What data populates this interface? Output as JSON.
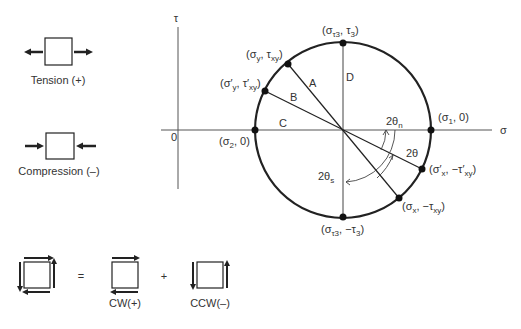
{
  "sign_convention": {
    "tension_label": "Tension (+)",
    "compression_label": "Compression (–)"
  },
  "mohr_circle": {
    "axis_labels": {
      "tau": "τ",
      "sigma": "σ",
      "origin": "0"
    },
    "line_labels": {
      "A": "A",
      "B": "B",
      "C": "C",
      "D": "D"
    },
    "points": {
      "top": {
        "open": "(σ",
        "sub1": "τ3",
        "mid": ", τ",
        "sub2": "3",
        "close": ")"
      },
      "bottom": {
        "open": "(σ",
        "sub1": "τ3",
        "mid": ", −τ",
        "sub2": "3",
        "close": ")"
      },
      "sigma_y": {
        "open": "(σ",
        "sub1": "y",
        "mid": ", τ",
        "sub2": "xy",
        "close": ")"
      },
      "sigma_y_p": {
        "open": "(σ′",
        "sub1": "y",
        "mid": ", τ′",
        "sub2": "xy",
        "close": ")"
      },
      "sigma_2": {
        "open": "(σ",
        "sub1": "2",
        "mid": ", 0",
        "sub2": "",
        "close": ")"
      },
      "sigma_1": {
        "open": "(σ",
        "sub1": "1",
        "mid": ", 0",
        "sub2": "",
        "close": ")"
      },
      "sigma_x_p": {
        "open": "(σ′",
        "sub1": "x",
        "mid": ", −τ′",
        "sub2": "xy",
        "close": ")"
      },
      "sigma_x": {
        "open": "(σ",
        "sub1": "x",
        "mid": ", −τ",
        "sub2": "xy",
        "close": ")"
      }
    },
    "angles": {
      "two_theta_n": {
        "main": "2θ",
        "sub": "n"
      },
      "two_theta_s": {
        "main": "2θ",
        "sub": "s"
      },
      "two_theta": {
        "main": "2θ"
      }
    }
  },
  "shear_convention": {
    "equals": "=",
    "plus": "+",
    "cw_label": "CW(+)",
    "ccw_label": "CCW(–)"
  },
  "colors": {
    "line": "#222222",
    "text": "#333333",
    "background": "#ffffff"
  }
}
